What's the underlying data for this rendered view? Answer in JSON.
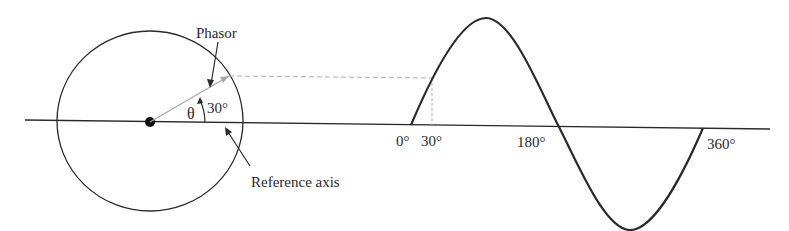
{
  "labels": {
    "phasor": "Phasor",
    "theta": "θ",
    "angle": "30°",
    "reference_axis": "Reference axis",
    "tick_0": "0°",
    "tick_30": "30°",
    "tick_180": "180°",
    "tick_360": "360°"
  },
  "colors": {
    "line": "#2a2a2a",
    "phasor": "#a8a8a8",
    "dashed": "#b0b0b0"
  },
  "geometry": {
    "circle_center": [
      150,
      122
    ],
    "circle_radius": 90,
    "phasor_angle_deg": 30,
    "sine_start_x": 411,
    "sine_end_x": 703,
    "sine_axis_y": 125,
    "sine_amplitude": 106
  }
}
